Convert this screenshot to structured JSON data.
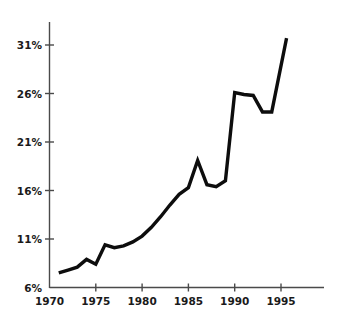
{
  "chart_data": {
    "type": "line",
    "title": "",
    "subtitle": "",
    "xlabel": "",
    "ylabel": "",
    "grid": false,
    "legend": false,
    "legend_position": "none",
    "xlim": [
      1970,
      1999.8
    ],
    "ylim": [
      6,
      33.5
    ],
    "x_ticks": [
      1970,
      1975,
      1980,
      1985,
      1990,
      1995
    ],
    "x_tick_labels": [
      "1970",
      "1975",
      "1980",
      "1985",
      "1990",
      "1995"
    ],
    "y_ticks": [
      6,
      11,
      16,
      21,
      26,
      31
    ],
    "y_tick_labels": [
      "6%",
      "11%",
      "16%",
      "21%",
      "26%",
      "31%"
    ],
    "series": [
      {
        "name": "",
        "color": "#0d0d0d",
        "x": [
          1971,
          1972,
          1973,
          1974,
          1975,
          1976,
          1977,
          1978,
          1979,
          1980,
          1981,
          1982,
          1983,
          1984,
          1985,
          1986,
          1987,
          1988,
          1989,
          1990,
          1991,
          1992,
          1993,
          1994,
          1995.6
        ],
        "values": [
          7.5,
          7.8,
          8.1,
          8.9,
          8.4,
          10.4,
          10.1,
          10.3,
          10.7,
          11.3,
          12.2,
          13.3,
          14.5,
          15.6,
          16.3,
          19.1,
          16.6,
          16.4,
          17.0,
          26.1,
          25.9,
          25.8,
          24.1,
          24.1,
          31.7
        ]
      }
    ]
  },
  "axes": {
    "x_axis_name": "year-axis",
    "y_axis_name": "percent-axis"
  }
}
